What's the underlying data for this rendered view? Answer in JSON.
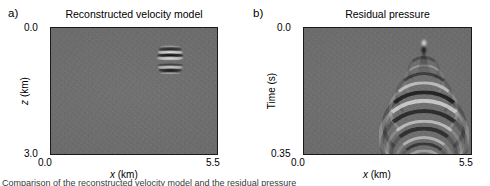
{
  "figure": {
    "background_color": "#ffffff",
    "panel_background_color": "#6e6e6e",
    "frame_color": "#1a1a1a",
    "caption_text": "Comparison of the reconstructed velocity model and the residual pressure"
  },
  "panels": [
    {
      "letter": "a)",
      "title": "Reconstructed velocity model",
      "xlabel_italic": "x",
      "xlabel_unit": " (km)",
      "ylabel_italic": "z",
      "ylabel_unit": " (km)",
      "x_ticks": [
        "0.0",
        "5.5"
      ],
      "y_ticks": [
        "0.0",
        "3.0"
      ]
    },
    {
      "letter": "b)",
      "title": "Residual pressure",
      "xlabel_italic": "x",
      "xlabel_unit": " (km)",
      "ylabel_italic": "",
      "ylabel_unit": "Time (s)",
      "x_ticks": [
        "0.0",
        "5.5"
      ],
      "y_ticks": [
        "0.0",
        "0.35"
      ]
    }
  ],
  "chart_data": [
    {
      "type": "heatmap",
      "title": "Reconstructed velocity model",
      "panel": "a",
      "xlabel": "x (km)",
      "ylabel": "z (km)",
      "xlim": [
        0.0,
        5.5
      ],
      "ylim": [
        3.0,
        0.0
      ],
      "y_axis_inverted": true,
      "grid": false,
      "legend": "none",
      "colormap": "gray",
      "background_value": 0,
      "description": "Near-uniform gray background of low-amplitude random noise with a single localized banded velocity anomaly.",
      "anomaly": {
        "center_x_km": 3.9,
        "center_z_km": 0.72,
        "width_km": 0.85,
        "height_km": 0.78,
        "structure": "stack of alternating bright and dark horizontal bands",
        "bands": [
          {
            "z_km": 0.43,
            "polarity": "bright",
            "amplitude": 0.35
          },
          {
            "z_km": 0.5,
            "polarity": "dark",
            "amplitude": 0.75
          },
          {
            "z_km": 0.57,
            "polarity": "bright",
            "amplitude": 0.85
          },
          {
            "z_km": 0.64,
            "polarity": "dark",
            "amplitude": 1.0
          },
          {
            "z_km": 0.72,
            "polarity": "bright",
            "amplitude": 0.8
          },
          {
            "z_km": 0.86,
            "polarity": "dark",
            "amplitude": 0.55
          },
          {
            "z_km": 0.93,
            "polarity": "bright",
            "amplitude": 0.7
          },
          {
            "z_km": 1.0,
            "polarity": "dark",
            "amplitude": 0.9
          },
          {
            "z_km": 1.07,
            "polarity": "bright",
            "amplitude": 0.4
          }
        ]
      }
    },
    {
      "type": "heatmap",
      "title": "Residual pressure",
      "panel": "b",
      "xlabel": "x (km)",
      "ylabel": "Time (s)",
      "xlim": [
        0.0,
        5.5
      ],
      "ylim": [
        0.35,
        0.0
      ],
      "y_axis_inverted": true,
      "grid": false,
      "legend": "none",
      "colormap": "gray",
      "background_value": 0,
      "description": "Noisy gray background with a point source near the top and a downward-opening hyperbolic diffraction wavetrain of alternating bright/dark arcs.",
      "source": {
        "x_km": 3.9,
        "t_s": 0.052,
        "bright_lobe_t_s": 0.04,
        "dark_lobe_t_s": 0.06
      },
      "diffraction_arcs": [
        {
          "apex_t_s": 0.085,
          "polarity": "dark",
          "half_width_km": 0.45,
          "amplitude": 0.35
        },
        {
          "apex_t_s": 0.105,
          "polarity": "bright",
          "half_width_km": 0.6,
          "amplitude": 0.3
        },
        {
          "apex_t_s": 0.13,
          "polarity": "dark",
          "half_width_km": 0.85,
          "amplitude": 0.55
        },
        {
          "apex_t_s": 0.155,
          "polarity": "bright",
          "half_width_km": 1.05,
          "amplitude": 0.6
        },
        {
          "apex_t_s": 0.18,
          "polarity": "dark",
          "half_width_km": 1.25,
          "amplitude": 0.85
        },
        {
          "apex_t_s": 0.205,
          "polarity": "bright",
          "half_width_km": 1.35,
          "amplitude": 0.7
        },
        {
          "apex_t_s": 0.232,
          "polarity": "dark",
          "half_width_km": 1.3,
          "amplitude": 0.75
        },
        {
          "apex_t_s": 0.258,
          "polarity": "bright",
          "half_width_km": 1.15,
          "amplitude": 0.6
        },
        {
          "apex_t_s": 0.281,
          "polarity": "dark",
          "half_width_km": 1.0,
          "amplitude": 0.7
        },
        {
          "apex_t_s": 0.303,
          "polarity": "bright",
          "half_width_km": 0.85,
          "amplitude": 0.55
        },
        {
          "apex_t_s": 0.322,
          "polarity": "dark",
          "half_width_km": 0.72,
          "amplitude": 0.6
        },
        {
          "apex_t_s": 0.34,
          "polarity": "bright",
          "half_width_km": 0.6,
          "amplitude": 0.4
        }
      ]
    }
  ]
}
